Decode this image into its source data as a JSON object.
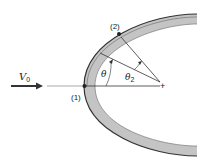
{
  "diagram": {
    "velocity_label": "V",
    "velocity_subscript": "0",
    "point1_label": "(1)",
    "point2_label": "(2)",
    "theta_label": "θ",
    "theta2_label": "θ",
    "theta2_subscript": "2",
    "center_mark": "+"
  },
  "colors": {
    "shell_fill": "#c4c4c4",
    "shell_edge": "#333333",
    "line": "#333333",
    "axis_light": "#aaaaaa"
  }
}
